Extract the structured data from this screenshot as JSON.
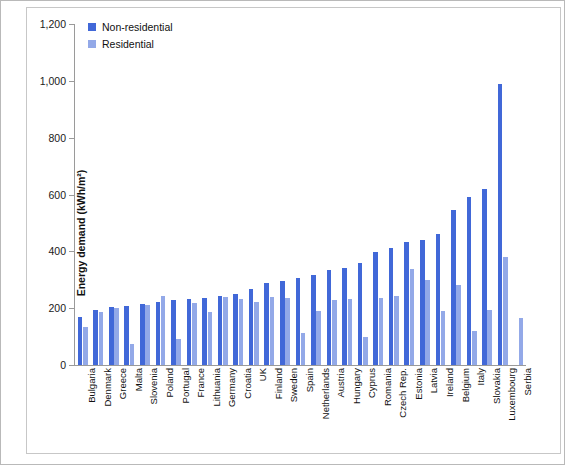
{
  "chart_data": {
    "type": "bar",
    "title": "",
    "xlabel": "",
    "ylabel": "Energy demand (kWh/m²)",
    "ylim": [
      0,
      1200
    ],
    "yticks": [
      0,
      200,
      400,
      600,
      800,
      1000,
      1200
    ],
    "ytick_labels": [
      "0",
      "200",
      "400",
      "600",
      "800",
      "1,000",
      "1,200"
    ],
    "grid": false,
    "legend_position": "top-left",
    "categories": [
      "Bulgaria",
      "Denmark",
      "Greece",
      "Malta",
      "Slovenia",
      "Poland",
      "Portugal",
      "France",
      "Lithuania",
      "Germany",
      "Croatia",
      "UK",
      "Finland",
      "Sweden",
      "Spain",
      "Netherlands",
      "Austria",
      "Hungary",
      "Cyprus",
      "Romania",
      "Czech Rep.",
      "Estonia",
      "Latvia",
      "Ireland",
      "Belgium",
      "Italy",
      "Slovakia",
      "Luxembourg",
      "Serbia"
    ],
    "series": [
      {
        "name": "Non-residential",
        "color": "#4168d8",
        "values": [
          170,
          195,
          203,
          208,
          215,
          222,
          228,
          232,
          237,
          243,
          250,
          268,
          288,
          297,
          305,
          318,
          334,
          340,
          358,
          398,
          413,
          432,
          440,
          462,
          546,
          592,
          618,
          990,
          null
        ]
      },
      {
        "name": "Residential",
        "color": "#93a9e8",
        "values": [
          135,
          188,
          202,
          75,
          210,
          243,
          92,
          218,
          187,
          240,
          232,
          222,
          238,
          235,
          112,
          190,
          230,
          232,
          100,
          235,
          243,
          338,
          298,
          190,
          283,
          120,
          195,
          380,
          165
        ]
      }
    ]
  },
  "legend": {
    "items": [
      {
        "label": "Non-residential",
        "color": "#4168d8"
      },
      {
        "label": "Residential",
        "color": "#93a9e8"
      }
    ]
  }
}
